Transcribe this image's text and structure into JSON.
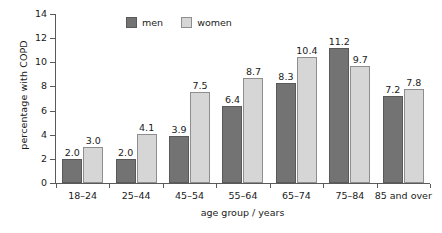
{
  "chart_data": {
    "type": "bar",
    "title": "",
    "subtitle": "",
    "xlabel": "age group / years",
    "ylabel": "percentage with COPD",
    "categories": [
      "18–24",
      "25–44",
      "45–54",
      "55–64",
      "65–74",
      "75–84",
      "85 and over"
    ],
    "series": [
      {
        "name": "men",
        "color": "#737373",
        "values": [
          2.0,
          2.0,
          3.9,
          6.4,
          8.3,
          11.2,
          7.2
        ]
      },
      {
        "name": "women",
        "color": "#d6d6d6",
        "values": [
          3.0,
          4.1,
          7.5,
          8.7,
          10.4,
          9.7,
          7.8
        ]
      }
    ],
    "value_labels": {
      "men": [
        "2.0",
        "2.0",
        "3.9",
        "6.4",
        "8.3",
        "11.2",
        "7.2"
      ],
      "women": [
        "3.0",
        "4.1",
        "7.5",
        "8.7",
        "10.4",
        "9.7",
        "7.8"
      ]
    },
    "ylim": [
      0,
      14
    ],
    "ytick_values": [
      0,
      2,
      4,
      6,
      8,
      10,
      12,
      14
    ],
    "ytick_labels": [
      "0",
      "2",
      "4",
      "6",
      "8",
      "10",
      "12",
      "14"
    ],
    "grid": false,
    "legend": {
      "position": "top-left-inside",
      "entries": [
        "men",
        "women"
      ]
    }
  },
  "legend": {
    "men_label": "men",
    "women_label": "women"
  },
  "axes": {
    "x_title": "age group / years",
    "y_title": "percentage with COPD"
  }
}
